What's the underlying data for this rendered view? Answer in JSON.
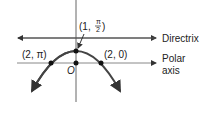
{
  "diagram": {
    "directrix_label": "Directrix",
    "polar_axis_label_line1": "Polar",
    "polar_axis_label_line2": "axis",
    "origin_label": "O",
    "points": [
      {
        "label": "(1, π/2)",
        "display_r": "1",
        "display_theta_num": "π",
        "display_theta_den": "2"
      },
      {
        "label": "(2, π)"
      },
      {
        "label": "(2, 0)"
      }
    ]
  }
}
